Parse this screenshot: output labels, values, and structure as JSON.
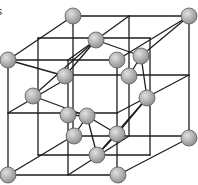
{
  "diagram": {
    "type": "crystal-lattice",
    "partial_label": "s",
    "colors": {
      "background": "#ffffff",
      "line": "#1e1e1e",
      "atom_fill_light": "#e0e0e0",
      "atom_fill_dark": "#8c8c8c",
      "atom_stroke": "#5a5a5a"
    },
    "atom_radius": 8,
    "atoms": [
      {
        "id": "A",
        "x": 73,
        "y": 16
      },
      {
        "id": "B",
        "x": 189,
        "y": 16
      },
      {
        "id": "C",
        "x": 96,
        "y": 40
      },
      {
        "id": "D",
        "x": 8,
        "y": 60
      },
      {
        "id": "E",
        "x": 117,
        "y": 60
      },
      {
        "id": "F",
        "x": 141,
        "y": 56
      },
      {
        "id": "G",
        "x": 65,
        "y": 76
      },
      {
        "id": "H",
        "x": 129,
        "y": 76
      },
      {
        "id": "I",
        "x": 33,
        "y": 96
      },
      {
        "id": "J",
        "x": 147,
        "y": 98
      },
      {
        "id": "K",
        "x": 68,
        "y": 115
      },
      {
        "id": "L",
        "x": 87,
        "y": 116
      },
      {
        "id": "M",
        "x": 74,
        "y": 136
      },
      {
        "id": "N",
        "x": 117,
        "y": 134
      },
      {
        "id": "O",
        "x": 189,
        "y": 138
      },
      {
        "id": "P",
        "x": 97,
        "y": 155
      },
      {
        "id": "Q",
        "x": 8,
        "y": 175
      },
      {
        "id": "R",
        "x": 118,
        "y": 175
      }
    ],
    "lines": [
      {
        "x1": 73,
        "y1": 16,
        "x2": 189,
        "y2": 16
      },
      {
        "x1": 73,
        "y1": 16,
        "x2": 8,
        "y2": 60
      },
      {
        "x1": 189,
        "y1": 16,
        "x2": 117,
        "y2": 60
      },
      {
        "x1": 189,
        "y1": 16,
        "x2": 189,
        "y2": 138
      },
      {
        "x1": 73,
        "y1": 16,
        "x2": 73,
        "y2": 136
      },
      {
        "x1": 129,
        "y1": 16,
        "x2": 129,
        "y2": 136
      },
      {
        "x1": 8,
        "y1": 60,
        "x2": 117,
        "y2": 60
      },
      {
        "x1": 8,
        "y1": 60,
        "x2": 8,
        "y2": 175
      },
      {
        "x1": 117,
        "y1": 60,
        "x2": 117,
        "y2": 175
      },
      {
        "x1": 68,
        "y1": 60,
        "x2": 68,
        "y2": 175
      },
      {
        "x1": 8,
        "y1": 175,
        "x2": 118,
        "y2": 175
      },
      {
        "x1": 8,
        "y1": 175,
        "x2": 73,
        "y2": 136
      },
      {
        "x1": 118,
        "y1": 175,
        "x2": 189,
        "y2": 138
      },
      {
        "x1": 73,
        "y1": 136,
        "x2": 189,
        "y2": 136
      },
      {
        "x1": 8,
        "y1": 113,
        "x2": 117,
        "y2": 113
      },
      {
        "x1": 8,
        "y1": 113,
        "x2": 73,
        "y2": 75
      },
      {
        "x1": 117,
        "y1": 113,
        "x2": 189,
        "y2": 75
      },
      {
        "x1": 73,
        "y1": 75,
        "x2": 189,
        "y2": 75
      },
      {
        "x1": 38,
        "y1": 38,
        "x2": 150,
        "y2": 38
      },
      {
        "x1": 38,
        "y1": 38,
        "x2": 38,
        "y2": 155
      },
      {
        "x1": 150,
        "y1": 38,
        "x2": 150,
        "y2": 155
      },
      {
        "x1": 38,
        "y1": 155,
        "x2": 150,
        "y2": 155
      },
      {
        "x1": 68,
        "y1": 60,
        "x2": 129,
        "y2": 16
      },
      {
        "x1": 68,
        "y1": 175,
        "x2": 129,
        "y2": 136
      },
      {
        "x1": 8,
        "y1": 60,
        "x2": 65,
        "y2": 76
      },
      {
        "x1": 33,
        "y1": 96,
        "x2": 96,
        "y2": 40
      },
      {
        "x1": 65,
        "y1": 76,
        "x2": 96,
        "y2": 40
      },
      {
        "x1": 96,
        "y1": 40,
        "x2": 141,
        "y2": 56
      },
      {
        "x1": 141,
        "y1": 56,
        "x2": 189,
        "y2": 16
      },
      {
        "x1": 141,
        "y1": 56,
        "x2": 129,
        "y2": 76
      },
      {
        "x1": 141,
        "y1": 56,
        "x2": 147,
        "y2": 98
      },
      {
        "x1": 147,
        "y1": 98,
        "x2": 117,
        "y2": 134
      },
      {
        "x1": 33,
        "y1": 96,
        "x2": 87,
        "y2": 116
      },
      {
        "x1": 68,
        "y1": 115,
        "x2": 87,
        "y2": 116
      },
      {
        "x1": 87,
        "y1": 116,
        "x2": 74,
        "y2": 136
      },
      {
        "x1": 87,
        "y1": 116,
        "x2": 117,
        "y2": 134
      },
      {
        "x1": 87,
        "y1": 116,
        "x2": 97,
        "y2": 155
      },
      {
        "x1": 117,
        "y1": 134,
        "x2": 97,
        "y2": 155
      },
      {
        "x1": 97,
        "y1": 155,
        "x2": 147,
        "y2": 98
      }
    ]
  }
}
